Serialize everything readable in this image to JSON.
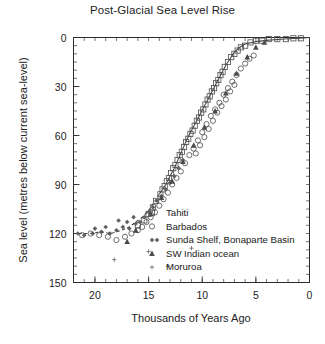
{
  "chart_data": {
    "type": "scatter",
    "title": "Post-Glacial Sea Level Rise",
    "xlabel": "Thousands of Years Ago",
    "ylabel": "Sea level (metres below current sea-level)",
    "xlim": [
      22,
      0
    ],
    "ylim": [
      150,
      0
    ],
    "x_ticks": [
      20,
      15,
      10,
      5,
      0
    ],
    "y_ticks": [
      0,
      30,
      60,
      90,
      120,
      150
    ],
    "x_tick_labels": [
      "20",
      "15",
      "10",
      "5",
      "0"
    ],
    "y_tick_labels": [
      "0",
      "30",
      "60",
      "90",
      "120",
      "150"
    ],
    "x_minor_step": 1,
    "y_minor_step": 5,
    "x_axis_reversed": true,
    "y_axis_inverted": true,
    "grid": false,
    "legend_position": "center-right-inside",
    "legend": [
      {
        "label": "Tahiti",
        "marker": "open-square"
      },
      {
        "label": "Barbados",
        "marker": "open-circle"
      },
      {
        "label": "Sunda Shelf, Bonaparte Basin",
        "marker": "small-diamond-pair"
      },
      {
        "label": "SW Indian ocean",
        "marker": "filled-triangle"
      },
      {
        "label": "Moruroa",
        "marker": "small-cross"
      }
    ],
    "fitted_curve": {
      "name": "sea level fit curve",
      "solid_segment": [
        [
          14.0,
          96
        ],
        [
          13.4,
          90
        ],
        [
          13.0,
          85
        ],
        [
          12.6,
          80
        ],
        [
          12.2,
          74
        ],
        [
          11.8,
          68
        ],
        [
          11.4,
          62
        ],
        [
          11.0,
          57
        ],
        [
          10.6,
          52
        ],
        [
          10.2,
          47
        ],
        [
          9.8,
          42
        ],
        [
          9.4,
          37
        ],
        [
          9.0,
          32
        ],
        [
          8.6,
          27
        ],
        [
          8.2,
          22
        ],
        [
          7.8,
          17
        ],
        [
          7.4,
          13
        ],
        [
          7.0,
          9
        ],
        [
          6.5,
          6
        ],
        [
          6.0,
          4
        ],
        [
          5.0,
          2.5
        ],
        [
          4.0,
          1.8
        ],
        [
          3.0,
          1.2
        ],
        [
          2.0,
          0.8
        ],
        [
          1.0,
          0.4
        ],
        [
          0.2,
          0.2
        ]
      ],
      "dashed_segment": [
        [
          21.5,
          120
        ],
        [
          20.5,
          120
        ],
        [
          19.5,
          119
        ],
        [
          18.5,
          120
        ],
        [
          17.5,
          118
        ],
        [
          16.8,
          116
        ],
        [
          16.2,
          113
        ],
        [
          15.6,
          110
        ],
        [
          15.0,
          106
        ],
        [
          14.5,
          101
        ],
        [
          14.0,
          96
        ]
      ]
    },
    "series": [
      {
        "name": "Tahiti",
        "marker": "open-square",
        "points": [
          [
            13.9,
            96
          ],
          [
            13.7,
            93
          ],
          [
            13.5,
            91
          ],
          [
            13.3,
            88
          ],
          [
            13.1,
            86
          ],
          [
            12.9,
            83
          ],
          [
            12.7,
            80
          ],
          [
            12.5,
            78
          ],
          [
            12.3,
            75
          ],
          [
            12.1,
            72
          ],
          [
            11.9,
            70
          ],
          [
            11.7,
            67
          ],
          [
            11.5,
            64
          ],
          [
            11.3,
            62
          ],
          [
            11.1,
            59
          ],
          [
            10.9,
            57
          ],
          [
            10.7,
            54
          ],
          [
            10.5,
            51
          ],
          [
            10.3,
            49
          ],
          [
            10.1,
            46
          ],
          [
            9.9,
            44
          ],
          [
            9.7,
            41
          ],
          [
            9.5,
            38
          ],
          [
            9.3,
            36
          ],
          [
            9.1,
            33
          ],
          [
            8.9,
            31
          ],
          [
            8.7,
            28
          ],
          [
            8.5,
            26
          ],
          [
            8.3,
            23
          ],
          [
            8.1,
            21
          ],
          [
            7.9,
            18
          ],
          [
            7.6,
            15
          ],
          [
            7.3,
            12
          ],
          [
            7.0,
            10
          ],
          [
            6.7,
            8
          ],
          [
            6.4,
            6
          ],
          [
            6.0,
            5
          ],
          [
            5.5,
            3
          ],
          [
            5.0,
            2
          ],
          [
            4.4,
            2
          ],
          [
            3.8,
            1
          ],
          [
            3.0,
            1
          ],
          [
            2.2,
            1
          ],
          [
            1.5,
            0.5
          ],
          [
            0.8,
            0.5
          ],
          [
            14.3,
            100
          ],
          [
            14.6,
            104
          ],
          [
            15.0,
            108
          ],
          [
            15.4,
            112
          ],
          [
            16.0,
            115
          ]
        ]
      },
      {
        "name": "Barbados",
        "marker": "open-circle",
        "points": [
          [
            17.2,
            122
          ],
          [
            16.6,
            120
          ],
          [
            16.0,
            118
          ],
          [
            15.6,
            116
          ],
          [
            15.2,
            113
          ],
          [
            14.8,
            110
          ],
          [
            14.4,
            107
          ],
          [
            14.0,
            103
          ],
          [
            13.6,
            99
          ],
          [
            13.2,
            95
          ],
          [
            12.8,
            90
          ],
          [
            12.4,
            86
          ],
          [
            12.0,
            82
          ],
          [
            11.6,
            77
          ],
          [
            11.2,
            72
          ],
          [
            10.8,
            68
          ],
          [
            10.4,
            63
          ],
          [
            10.0,
            58
          ],
          [
            9.6,
            53
          ],
          [
            9.2,
            48
          ],
          [
            8.8,
            44
          ],
          [
            8.4,
            40
          ],
          [
            8.0,
            35
          ],
          [
            7.6,
            31
          ],
          [
            7.2,
            27
          ],
          [
            6.8,
            23
          ],
          [
            6.4,
            19
          ],
          [
            6.0,
            16
          ],
          [
            5.6,
            13
          ],
          [
            5.2,
            11
          ],
          [
            10.6,
            71
          ],
          [
            10.2,
            66
          ],
          [
            9.8,
            61
          ],
          [
            9.4,
            56
          ],
          [
            9.0,
            51
          ],
          [
            8.6,
            46
          ],
          [
            8.2,
            42
          ],
          [
            7.8,
            38
          ],
          [
            7.4,
            33
          ],
          [
            7.0,
            29
          ],
          [
            18.0,
            124
          ],
          [
            18.8,
            122
          ],
          [
            19.6,
            121
          ],
          [
            20.4,
            120
          ],
          [
            21.2,
            121
          ]
        ]
      },
      {
        "name": "Sunda Shelf, Bonaparte Basin",
        "marker": "small-diamond-pair",
        "points": [
          [
            21.6,
            120
          ],
          [
            21.0,
            121
          ],
          [
            20.2,
            120
          ],
          [
            19.4,
            119
          ],
          [
            18.6,
            120
          ],
          [
            18.0,
            118
          ],
          [
            17.4,
            116
          ],
          [
            16.8,
            117
          ],
          [
            16.2,
            114
          ],
          [
            15.8,
            113
          ],
          [
            15.4,
            110
          ],
          [
            15.0,
            107
          ],
          [
            14.6,
            104
          ],
          [
            14.2,
            100
          ],
          [
            13.8,
            97
          ],
          [
            13.4,
            93
          ],
          [
            13.0,
            89
          ],
          [
            12.6,
            85
          ],
          [
            12.2,
            80
          ],
          [
            11.8,
            75
          ],
          [
            17.8,
            112
          ],
          [
            17.0,
            113
          ],
          [
            16.4,
            110
          ],
          [
            19.0,
            116
          ],
          [
            20.0,
            117
          ]
        ]
      },
      {
        "name": "SW Indian ocean",
        "marker": "filled-triangle",
        "points": [
          [
            14.8,
            108
          ],
          [
            13.8,
            98
          ],
          [
            12.8,
            88
          ],
          [
            11.8,
            76
          ],
          [
            10.8,
            66
          ],
          [
            9.8,
            55
          ],
          [
            8.8,
            45
          ],
          [
            7.8,
            34
          ],
          [
            6.8,
            22
          ],
          [
            5.8,
            12
          ],
          [
            5.0,
            6
          ],
          [
            4.2,
            3
          ],
          [
            16.2,
            118
          ],
          [
            17.0,
            125
          ]
        ]
      },
      {
        "name": "Moruroa",
        "marker": "small-cross",
        "points": [
          [
            18.2,
            136
          ],
          [
            13.2,
            140
          ],
          [
            15.0,
            131
          ],
          [
            11.0,
            129
          ]
        ]
      }
    ]
  }
}
